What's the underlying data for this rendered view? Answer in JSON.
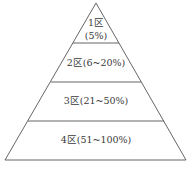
{
  "diagram": {
    "type": "pyramid",
    "stroke_color": "#555555",
    "text_color": "#3a3a3a",
    "background": "#ffffff",
    "tiers": [
      {
        "zone": "1区",
        "range": "(5%)",
        "label_line1": "1区",
        "label_line2": "(5%)"
      },
      {
        "zone": "2区",
        "range": "(6~20%)",
        "label": "2区(6~20%)"
      },
      {
        "zone": "3区",
        "range": "(21~50%)",
        "label": "3区(21~50%)"
      },
      {
        "zone": "4区",
        "range": "(51~100%)",
        "label": "4区(51~100%)"
      }
    ]
  }
}
